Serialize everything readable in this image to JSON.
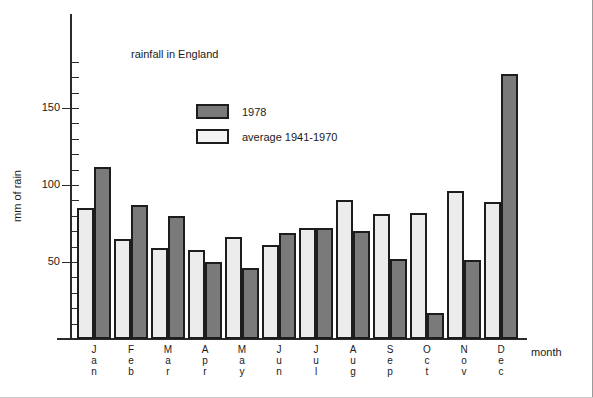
{
  "chart_data": {
    "type": "bar",
    "title": "rainfall in England",
    "xlabel": "month",
    "ylabel": "mm of rain",
    "categories": [
      "Jan",
      "Feb",
      "Mar",
      "Apr",
      "May",
      "Jun",
      "Jul",
      "Aug",
      "Sep",
      "Oct",
      "Nov",
      "Dec"
    ],
    "series": [
      {
        "name": "average 1941-1970",
        "color": "#ececec",
        "values": [
          85,
          65,
          59,
          58,
          66,
          61,
          72,
          90,
          81,
          82,
          96,
          89
        ]
      },
      {
        "name": "1978",
        "color": "#7a7a7a",
        "values": [
          112,
          87,
          80,
          50,
          46,
          69,
          72,
          70,
          52,
          17,
          51,
          172
        ]
      }
    ],
    "series_order_in_group": [
      "average 1941-1970",
      "1978"
    ],
    "ylim": [
      0,
      185
    ],
    "yticks_major": [
      50,
      100,
      150
    ],
    "yticks_minor_step": 10,
    "grid": false,
    "legend_position": "top-center",
    "legend_entries": [
      {
        "label": "1978",
        "swatch": "#7a7a7a"
      },
      {
        "label": "average 1941-1970",
        "swatch": "#ffffff"
      }
    ]
  },
  "axis": {
    "tick_labels": [
      "150",
      "100",
      "50"
    ]
  }
}
